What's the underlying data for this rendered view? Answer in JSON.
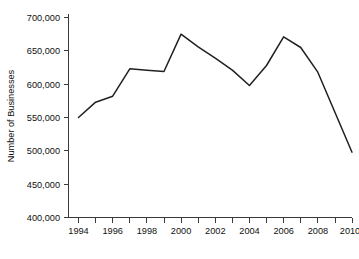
{
  "chart_data": {
    "type": "line",
    "title": "",
    "subtitle": "",
    "xlabel": "",
    "ylabel": "Number of Businesses",
    "x": [
      1994,
      1995,
      1996,
      1997,
      1998,
      1999,
      2000,
      2001,
      2002,
      2003,
      2004,
      2005,
      2006,
      2007,
      2008,
      2009,
      2010
    ],
    "values": [
      550000,
      573000,
      582000,
      623000,
      621000,
      619000,
      675000,
      656000,
      639000,
      621000,
      598000,
      628000,
      671000,
      655000,
      618000,
      558000,
      498000
    ],
    "series": [
      {
        "name": "Number of Businesses",
        "color": "#231f20",
        "values": [
          550000,
          573000,
          582000,
          623000,
          621000,
          619000,
          675000,
          656000,
          639000,
          621000,
          598000,
          628000,
          671000,
          655000,
          618000,
          558000,
          498000
        ]
      }
    ],
    "xlim": [
      1994,
      2010
    ],
    "ylim": [
      400000,
      700000
    ],
    "y_ticks": [
      400000,
      450000,
      500000,
      550000,
      600000,
      650000,
      700000
    ],
    "y_tick_labels": [
      "400,000",
      "450,000",
      "500,000",
      "550,000",
      "600,000",
      "650,000",
      "700,000"
    ],
    "x_ticks": [
      1994,
      1995,
      1996,
      1997,
      1998,
      1999,
      2000,
      2001,
      2002,
      2003,
      2004,
      2005,
      2006,
      2007,
      2008,
      2009,
      2010
    ],
    "x_tick_labels": [
      "1994",
      "",
      "1996",
      "",
      "1998",
      "",
      "2000",
      "",
      "2002",
      "",
      "2004",
      "",
      "2006",
      "",
      "2008",
      "",
      "2010"
    ],
    "x_labeled_ticks": [
      1994,
      1996,
      1998,
      2000,
      2002,
      2004,
      2006,
      2008,
      2010
    ],
    "x_labeled_text": [
      "1994",
      "1996",
      "1998",
      "2000",
      "2002",
      "2004",
      "2006",
      "2008",
      "2010"
    ],
    "grid": false,
    "legend": false,
    "legend_position": "none",
    "annotations": []
  },
  "axes": {
    "y_label": "Number of Businesses",
    "y_tick_0": "400,000",
    "y_tick_1": "450,000",
    "y_tick_2": "500,000",
    "y_tick_3": "550,000",
    "y_tick_4": "600,000",
    "y_tick_5": "650,000",
    "y_tick_6": "700,000",
    "x_tick_0": "1994",
    "x_tick_1": "1996",
    "x_tick_2": "1998",
    "x_tick_3": "2000",
    "x_tick_4": "2002",
    "x_tick_5": "2004",
    "x_tick_6": "2006",
    "x_tick_7": "2008",
    "x_tick_8": "2010"
  },
  "colors": {
    "line": "#231f20",
    "axis": "#3a3a3a",
    "text": "#101010",
    "background": "#ffffff"
  }
}
